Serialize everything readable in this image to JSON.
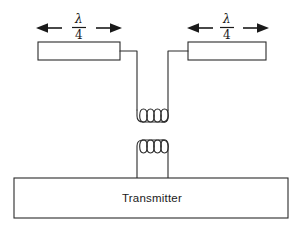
{
  "diagram": {
    "background_color": "#ffffff",
    "line_color": "#2b2b2b",
    "text_color": "#1a1a1a",
    "dimension_labels": [
      {
        "id": "left-quarter-wave",
        "numerator": "λ",
        "denominator": "4",
        "full_text": "λ/4",
        "arrow_left": "◀",
        "arrow_right": "▶"
      },
      {
        "id": "right-quarter-wave",
        "numerator": "λ",
        "denominator": "4",
        "full_text": "λ/4",
        "arrow_left": "◀",
        "arrow_right": "▶"
      }
    ],
    "elements": [
      {
        "id": "left-radiator",
        "label": ""
      },
      {
        "id": "right-radiator",
        "label": ""
      }
    ],
    "coils": [
      {
        "id": "antenna-link-coil",
        "turns": 4,
        "orientation": "u-shape-down"
      },
      {
        "id": "transmitter-link-coil",
        "turns": 4,
        "orientation": "u-shape-up"
      }
    ],
    "transmitter": {
      "label": "Transmitter"
    }
  }
}
